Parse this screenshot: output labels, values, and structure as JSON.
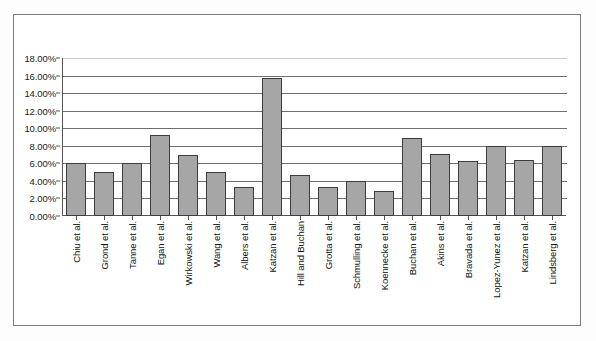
{
  "chart_data": {
    "type": "bar",
    "title": "",
    "xlabel": "",
    "ylabel": "",
    "ylim": [
      0,
      18
    ],
    "ytick_values": [
      0,
      2,
      4,
      6,
      8,
      10,
      12,
      14,
      16,
      18
    ],
    "ytick_labels": [
      "0.00%",
      "2.00%",
      "4.00%",
      "6.00%",
      "8.00%",
      "10.00%",
      "12.00%",
      "14.00%",
      "16.00%",
      "18.00%"
    ],
    "grid": true,
    "legend": "none",
    "bar_color": "#a6a6a6",
    "bar_edge_color": "#3d3d3d",
    "categories": [
      "Chiu et al.",
      "Grond et al.",
      "Tanne et al.",
      "Egan et al.",
      "Wirkowski et al.",
      "Wang et al.",
      "Albers et al.",
      "Katzan et al.",
      "Hill and Buchan",
      "Grotta et al.",
      "Schmulling et al.",
      "Koennecke et al.",
      "Buchan et al.",
      "Akins et al.",
      "Bravada et al.",
      "Lopez-Yunez et al.",
      "Katzan et al.",
      "Lindsberg et al."
    ],
    "values": [
      6.0,
      5.0,
      6.0,
      9.2,
      7.0,
      5.0,
      3.3,
      15.7,
      4.7,
      3.3,
      4.0,
      2.8,
      8.9,
      7.1,
      6.3,
      8.0,
      6.4,
      8.0
    ],
    "value_labels": [
      "6.00%",
      "5.00%",
      "6.00%",
      "9.20%",
      "7.00%",
      "5.00%",
      "3.30%",
      "15.70%",
      "4.70%",
      "3.30%",
      "4.00%",
      "2.80%",
      "8.90%",
      "7.10%",
      "6.30%",
      "8.00%",
      "6.40%",
      "8.00%"
    ]
  }
}
